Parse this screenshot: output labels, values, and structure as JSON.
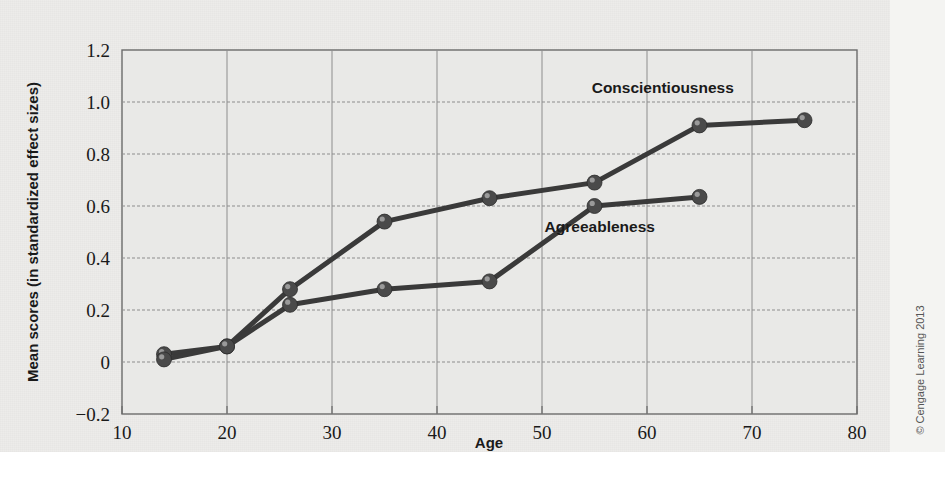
{
  "figure": {
    "credit": "© Cengage Learning 2013",
    "background_color": "#edecea",
    "plot_background_color": "#e9e9e7",
    "line_color": "#3a3a3a",
    "grid_color": "#8d8d8d"
  },
  "chart_data": {
    "type": "line",
    "title": "",
    "xlabel": "Age",
    "ylabel": "Mean scores (in standardized effect sizes)",
    "xlim": [
      10,
      80
    ],
    "ylim": [
      -0.2,
      1.2
    ],
    "xticks": [
      10,
      20,
      30,
      40,
      50,
      60,
      70,
      80
    ],
    "xtick_labels": [
      "10",
      "20",
      "30",
      "40",
      "50",
      "60",
      "70",
      "80"
    ],
    "yticks": [
      -0.2,
      0,
      0.2,
      0.4,
      0.6,
      0.8,
      1.0,
      1.2
    ],
    "ytick_labels": [
      "−0.2",
      "0",
      "0.2",
      "0.4",
      "0.6",
      "0.8",
      "1.0",
      "1.2"
    ],
    "grid": true,
    "legend": "inline-labels",
    "series": [
      {
        "name": "Conscientiousness",
        "label_x": 61.5,
        "label_y": 1.035,
        "x": [
          14,
          20,
          26,
          35,
          45,
          55,
          65,
          75
        ],
        "values": [
          0.03,
          0.06,
          0.28,
          0.54,
          0.63,
          0.69,
          0.91,
          0.93
        ]
      },
      {
        "name": "Agreeableness",
        "label_x": 55.5,
        "label_y": 0.5,
        "x": [
          14,
          20,
          26,
          35,
          45,
          55,
          65
        ],
        "values": [
          0.01,
          0.06,
          0.22,
          0.28,
          0.31,
          0.6,
          0.635
        ]
      }
    ]
  }
}
